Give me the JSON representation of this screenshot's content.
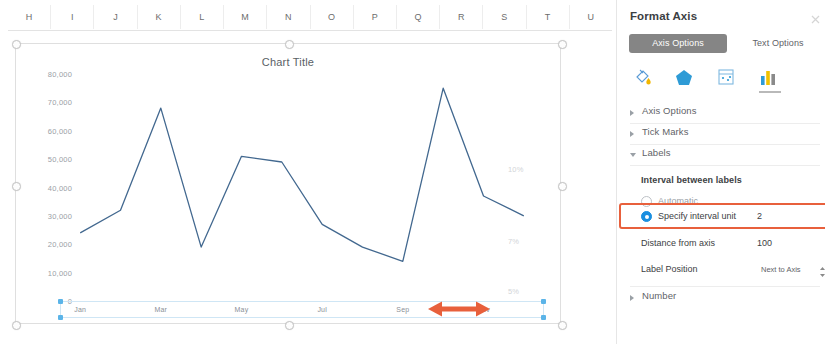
{
  "spreadsheet": {
    "columns": [
      "H",
      "I",
      "J",
      "K",
      "L",
      "M",
      "N",
      "O",
      "P",
      "Q",
      "R",
      "S",
      "T",
      "U"
    ]
  },
  "chart_data": {
    "type": "line",
    "title": "Chart Title",
    "xlabel": "",
    "ylabel": "",
    "grid": false,
    "legend": "none",
    "categories": [
      "Jan",
      "Feb",
      "Mar",
      "Apr",
      "May",
      "Jun",
      "Jul",
      "Aug",
      "Sep",
      "Oct",
      "Nov",
      "Dec"
    ],
    "visible_tick_labels": [
      "Jan",
      "Mar",
      "May",
      "Jul",
      "Sep",
      "Nov"
    ],
    "tick_label_interval": 2,
    "ylim": [
      0,
      80000
    ],
    "yticks": [
      "0",
      "10,000",
      "20,000",
      "30,000",
      "40,000",
      "50,000",
      "60,000",
      "70,000",
      "80,000"
    ],
    "ytick_values": [
      0,
      10000,
      20000,
      30000,
      40000,
      50000,
      60000,
      70000,
      80000
    ],
    "secondary_axis_labels": [
      "10%",
      "7%",
      "5%"
    ],
    "series": [
      {
        "name": "Series 1",
        "color": "#42688f",
        "values": [
          24000,
          32000,
          68000,
          19000,
          51000,
          49000,
          27000,
          19000,
          14000,
          75000,
          37000,
          30000
        ]
      }
    ],
    "annotation": {
      "type": "double-arrow",
      "color": "#e8603c",
      "between": [
        "Sep",
        "Nov"
      ]
    }
  },
  "pane": {
    "title": "Format Axis",
    "close_label": "×",
    "tabs": [
      {
        "label": "Axis Options",
        "selected": true
      },
      {
        "label": "Text Options",
        "selected": false
      }
    ],
    "icons": [
      {
        "name": "fill-bucket-icon",
        "selected": false
      },
      {
        "name": "effects-pentagon-icon",
        "selected": false
      },
      {
        "name": "size-properties-icon",
        "selected": false
      },
      {
        "name": "axis-options-chart-icon",
        "selected": true
      }
    ],
    "sections": [
      {
        "label": "Axis Options",
        "expanded": false
      },
      {
        "label": "Tick Marks",
        "expanded": false
      },
      {
        "label": "Labels",
        "expanded": true
      },
      {
        "label": "Number",
        "expanded": false
      }
    ],
    "labels_group": {
      "title": "Interval between labels",
      "options": [
        {
          "label": "Automatic",
          "selected": false
        },
        {
          "label": "Specify interval unit",
          "selected": true,
          "value": "2"
        }
      ],
      "distance_from_axis": {
        "label": "Distance from axis",
        "value": "100"
      },
      "label_position": {
        "label": "Label Position",
        "value": "Next to Axis"
      }
    },
    "highlight_color": "#e8603c"
  }
}
